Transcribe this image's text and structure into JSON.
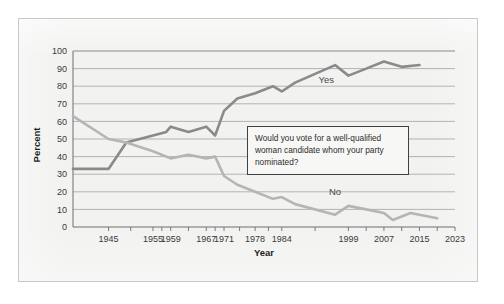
{
  "chart_data": {
    "type": "line",
    "title": "",
    "xlabel": "Year",
    "ylabel": "Percent",
    "ylim": [
      0,
      100
    ],
    "ytick_values": [
      0,
      10,
      20,
      30,
      40,
      50,
      60,
      70,
      80,
      90,
      100
    ],
    "ytick_labels": [
      "0",
      "10",
      "20",
      "30",
      "40",
      "50",
      "60",
      "70",
      "80",
      "90",
      "100"
    ],
    "xlim": [
      1937,
      2023
    ],
    "xtick_labels": [
      "1945",
      "1955",
      "1959",
      "1967",
      "1971",
      "1978",
      "1984",
      "1999",
      "2007",
      "2015",
      "2023"
    ],
    "xtick_positions": [
      1945,
      1955,
      1959,
      1967,
      1971,
      1978,
      1984,
      1999,
      2007,
      2015,
      2023
    ],
    "grid": "horizontal",
    "legend_position": "inline-labels",
    "annotation": "Would you vote for a well-qualified woman candidate whom your party nominated?",
    "series": [
      {
        "name": "Yes",
        "color": "#8a8a8a",
        "label_x": 1994,
        "label_y": 82,
        "points": [
          [
            1937,
            33
          ],
          [
            1945,
            33
          ],
          [
            1949,
            48
          ],
          [
            1955,
            52
          ],
          [
            1958,
            54
          ],
          [
            1959,
            57
          ],
          [
            1963,
            54
          ],
          [
            1967,
            57
          ],
          [
            1969,
            52
          ],
          [
            1971,
            66
          ],
          [
            1974,
            73
          ],
          [
            1978,
            76
          ],
          [
            1982,
            80
          ],
          [
            1984,
            77
          ],
          [
            1987,
            82
          ],
          [
            1996,
            92
          ],
          [
            1999,
            86
          ],
          [
            2003,
            90
          ],
          [
            2007,
            94
          ],
          [
            2011,
            91
          ],
          [
            2015,
            92
          ]
        ]
      },
      {
        "name": "No",
        "color": "#b5b5b5",
        "label_x": 1996,
        "label_y": 18,
        "points": [
          [
            1937,
            63
          ],
          [
            1945,
            50
          ],
          [
            1949,
            48
          ],
          [
            1955,
            43
          ],
          [
            1959,
            39
          ],
          [
            1963,
            41
          ],
          [
            1967,
            39
          ],
          [
            1969,
            40
          ],
          [
            1971,
            29
          ],
          [
            1974,
            24
          ],
          [
            1978,
            20
          ],
          [
            1982,
            16
          ],
          [
            1984,
            17
          ],
          [
            1987,
            13
          ],
          [
            1996,
            7
          ],
          [
            1999,
            12
          ],
          [
            2003,
            10
          ],
          [
            2007,
            8
          ],
          [
            2009,
            4
          ],
          [
            2013,
            8
          ],
          [
            2015,
            7
          ],
          [
            2019,
            5
          ]
        ]
      }
    ]
  },
  "annotation": {
    "text": "Would you vote for a well-qualified woman candidate whom your party nominated?"
  }
}
